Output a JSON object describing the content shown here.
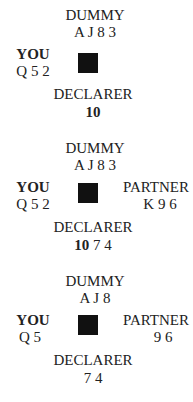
{
  "diagrams": [
    {
      "north": {
        "label": "DUMMY",
        "cards": "A J 8 3"
      },
      "west": {
        "label": "YOU",
        "cards": "Q 5 2"
      },
      "east": {
        "label": "",
        "cards": ""
      },
      "south": {
        "label": "DECLARER",
        "played": "10",
        "cards": ""
      }
    },
    {
      "north": {
        "label": "DUMMY",
        "cards": "A J 8 3"
      },
      "west": {
        "label": "YOU",
        "cards": "Q 5 2"
      },
      "east": {
        "label": "PARTNER",
        "cards": "K 9 6"
      },
      "south": {
        "label": "DECLARER",
        "played": "10",
        "cards": " 7 4"
      }
    },
    {
      "north": {
        "label": "DUMMY",
        "cards": "A J 8"
      },
      "west": {
        "label": "YOU",
        "cards": "Q 5"
      },
      "east": {
        "label": "PARTNER",
        "cards": "9 6"
      },
      "south": {
        "label": "DECLARER",
        "played": "",
        "cards": "7 4"
      }
    }
  ],
  "table_icon": "table-square"
}
